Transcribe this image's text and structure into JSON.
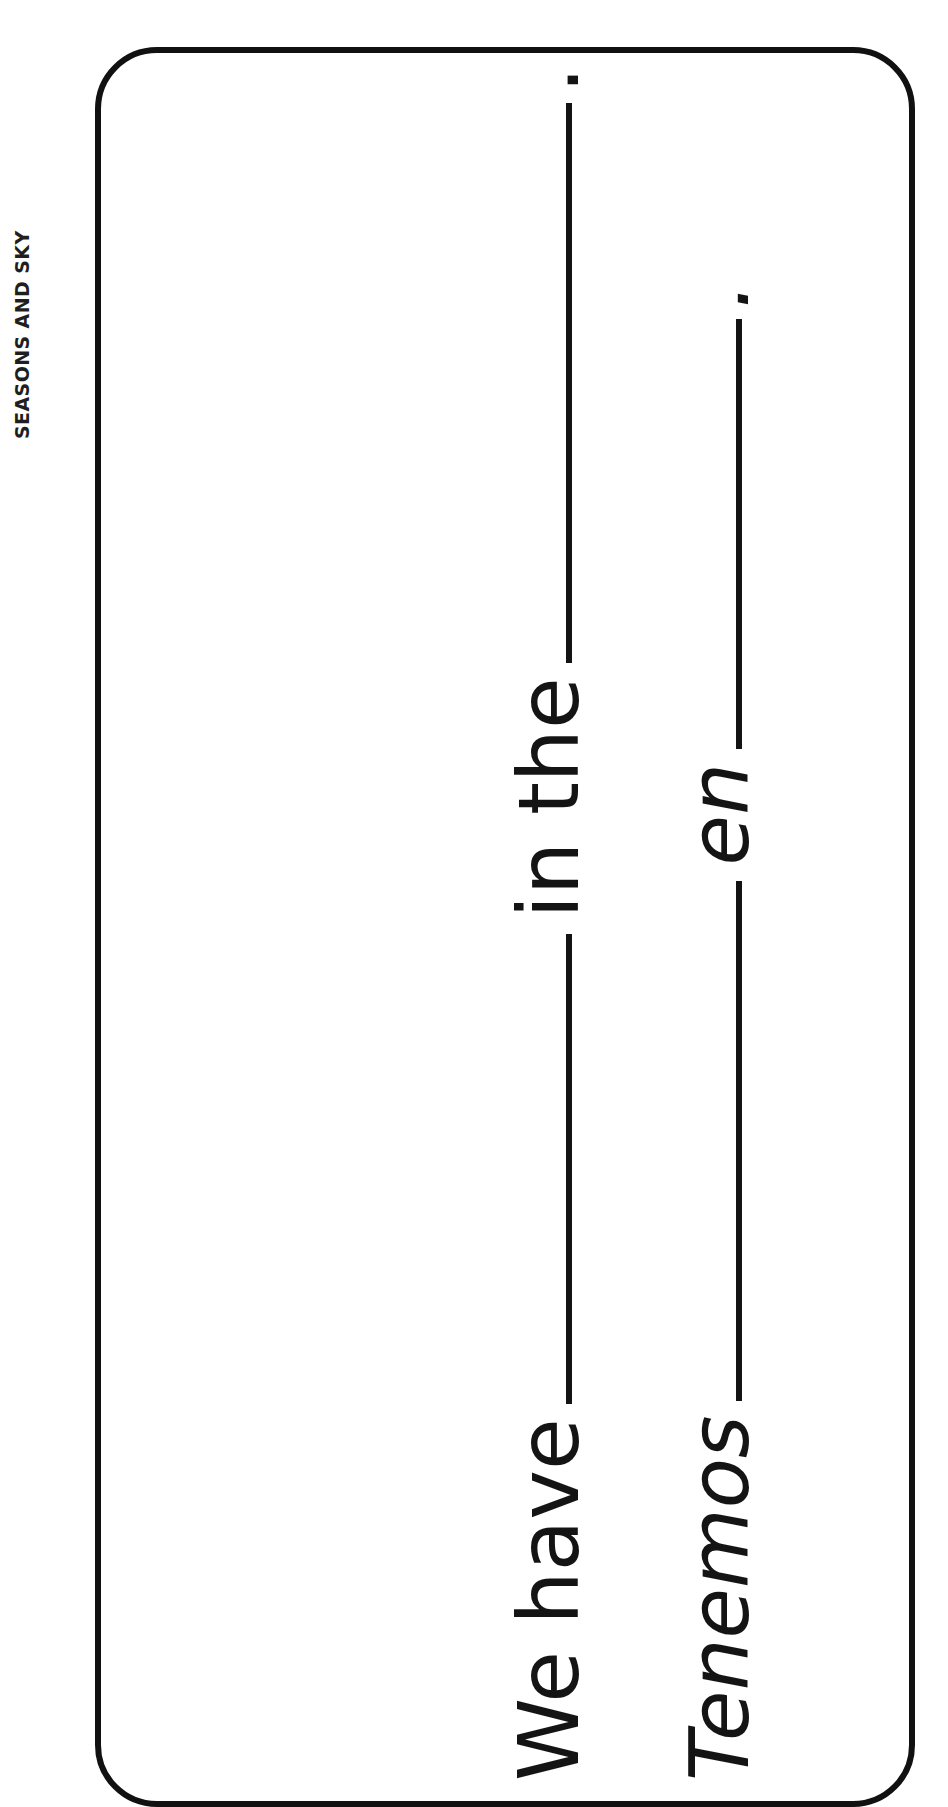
{
  "header": {
    "label": "SEASONS AND SKY",
    "orientation": "rotated-90-ccw"
  },
  "card": {
    "border_color": "#111111",
    "background": "#ffffff",
    "corner_radius_px": 62
  },
  "worksheet": {
    "lines": [
      {
        "id": "line-english",
        "language": "English",
        "style": "roman",
        "segments": [
          {
            "type": "text",
            "value": "We have"
          },
          {
            "type": "blank",
            "value": ""
          },
          {
            "type": "text",
            "value": "in the"
          },
          {
            "type": "blank",
            "value": ""
          },
          {
            "type": "text",
            "value": "."
          }
        ],
        "full_text": "We have ________ in the ________."
      },
      {
        "id": "line-spanish",
        "language": "Spanish",
        "style": "italic",
        "segments": [
          {
            "type": "text",
            "value": "Tenemos"
          },
          {
            "type": "blank",
            "value": ""
          },
          {
            "type": "text",
            "value": "en"
          },
          {
            "type": "blank",
            "value": ""
          },
          {
            "type": "text",
            "value": "."
          }
        ],
        "full_text": "Tenemos ________ en ________."
      }
    ],
    "labels": {
      "we_have": "We have",
      "in_the": "in the",
      "tenemos": "Tenemos",
      "en": "en",
      "period": "."
    }
  },
  "colors": {
    "ink": "#141414",
    "rule": "#141414",
    "paper": "#ffffff"
  }
}
